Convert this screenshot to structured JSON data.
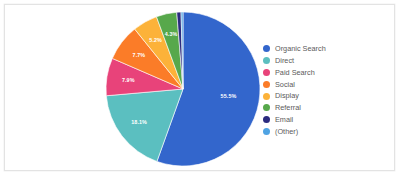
{
  "chart_data": {
    "type": "pie",
    "title": "",
    "subtitle": "",
    "xlabel": "",
    "ylabel": "",
    "legend_position": "right",
    "grid": false,
    "start_angle_deg": 0,
    "direction": "clockwise",
    "labels_shown_on_slices": true,
    "categories": [
      "Organic Search",
      "Direct",
      "Paid Search",
      "Social",
      "Display",
      "Referral",
      "Email",
      "(Other)"
    ],
    "values": [
      55.5,
      18.1,
      7.9,
      7.7,
      5.2,
      4.3,
      0.9,
      0.4
    ],
    "value_labels": [
      "55.5%",
      "18.1%",
      "7.9%",
      "7.7%",
      "5.2%",
      "4.3%",
      "",
      ""
    ],
    "colors": [
      "#3366cc",
      "#5bbfc0",
      "#e8437a",
      "#fb7c28",
      "#fcb239",
      "#57a84b",
      "#2b2b7f",
      "#4fa3e3"
    ],
    "slices": [
      {
        "label": "Organic Search",
        "value": 55.5,
        "value_label": "55.5%",
        "color": "#3366cc"
      },
      {
        "label": "Direct",
        "value": 18.1,
        "value_label": "18.1%",
        "color": "#5bbfc0"
      },
      {
        "label": "Paid Search",
        "value": 7.9,
        "value_label": "7.9%",
        "color": "#e8437a"
      },
      {
        "label": "Social",
        "value": 7.7,
        "value_label": "7.7%",
        "color": "#fb7c28"
      },
      {
        "label": "Display",
        "value": 5.2,
        "value_label": "5.2%",
        "color": "#fcb239"
      },
      {
        "label": "Referral",
        "value": 4.3,
        "value_label": "4.3%",
        "color": "#57a84b"
      },
      {
        "label": "Email",
        "value": 0.9,
        "value_label": "",
        "color": "#2b2b7f"
      },
      {
        "label": "(Other)",
        "value": 0.4,
        "value_label": "",
        "color": "#4fa3e3"
      }
    ]
  },
  "legend": {
    "items": [
      {
        "label": "Organic Search",
        "color": "#3366cc"
      },
      {
        "label": "Direct",
        "color": "#5bbfc0"
      },
      {
        "label": "Paid Search",
        "color": "#e8437a"
      },
      {
        "label": "Social",
        "color": "#fb7c28"
      },
      {
        "label": "Display",
        "color": "#fcb239"
      },
      {
        "label": "Referral",
        "color": "#57a84b"
      },
      {
        "label": "Email",
        "color": "#2b2b7f"
      },
      {
        "label": "(Other)",
        "color": "#4fa3e3"
      }
    ]
  },
  "card": {
    "background": "#ffffff",
    "border_color": "#e3e3e3"
  }
}
